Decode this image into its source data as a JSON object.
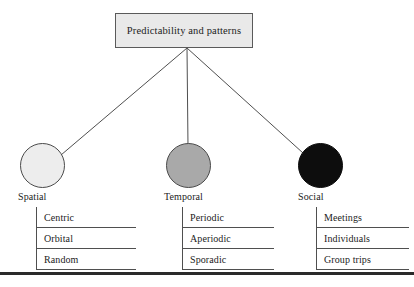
{
  "figure": {
    "root": {
      "label": "Predictability and patterns"
    },
    "branches": [
      {
        "key": "spatial",
        "label": "Spatial",
        "marker_icon": "filled-circle-icon",
        "marker_color": "#ededed",
        "items": [
          {
            "label": "Centric"
          },
          {
            "label": "Orbital"
          },
          {
            "label": "Random"
          }
        ]
      },
      {
        "key": "temporal",
        "label": "Temporal",
        "marker_icon": "filled-circle-icon",
        "marker_color": "#a9a9a9",
        "items": [
          {
            "label": "Periodic"
          },
          {
            "label": "Aperiodic"
          },
          {
            "label": "Sporadic"
          }
        ]
      },
      {
        "key": "social",
        "label": "Social",
        "marker_icon": "filled-circle-icon",
        "marker_color": "#0d0d0d",
        "items": [
          {
            "label": "Meetings"
          },
          {
            "label": "Individuals"
          },
          {
            "label": "Group trips"
          }
        ]
      }
    ],
    "colors": {
      "line": "#4f4f4f",
      "box_fill": "#e9e9e9",
      "box_border": "#5a5a5a",
      "text": "#1c1c1c",
      "bottom_rule": "#2a2a2a"
    }
  }
}
